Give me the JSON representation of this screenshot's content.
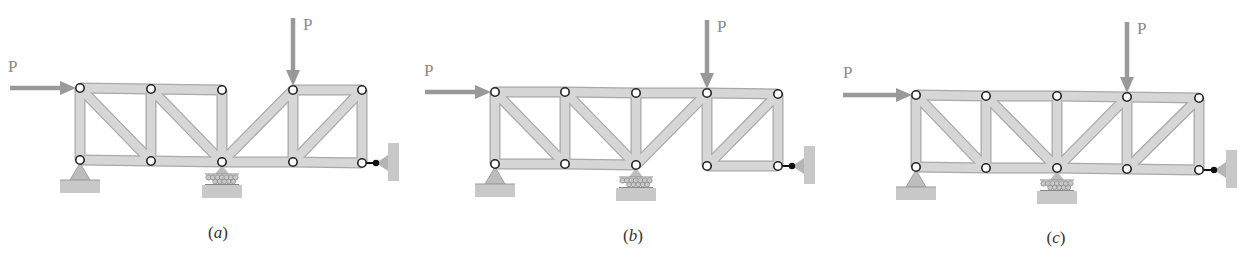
{
  "figure": {
    "panels": [
      {
        "id": "a",
        "caption": "(a)",
        "caption_letter": "a",
        "caption_pos": [
          218,
          237
        ],
        "load_label": "P",
        "joints": {
          "top": [
            [
              80,
              88
            ],
            [
              151,
              89
            ],
            [
              222,
              90
            ],
            [
              293,
              90
            ],
            [
              362,
              90
            ]
          ],
          "bottom": [
            [
              80,
              160
            ],
            [
              151,
              161
            ],
            [
              222,
              162
            ],
            [
              293,
              162
            ],
            [
              362,
              163
            ]
          ]
        },
        "members": [
          [
            "t0",
            "t1"
          ],
          [
            "t1",
            "t2"
          ],
          [
            "t3",
            "t4"
          ],
          [
            "b0",
            "b1"
          ],
          [
            "b1",
            "b2"
          ],
          [
            "b2",
            "b3"
          ],
          [
            "b3",
            "b4"
          ],
          [
            "t0",
            "b0"
          ],
          [
            "t1",
            "b1"
          ],
          [
            "t2",
            "b2"
          ],
          [
            "t3",
            "b3"
          ],
          [
            "t4",
            "b4"
          ],
          [
            "t0",
            "b1"
          ],
          [
            "t1",
            "b2"
          ],
          [
            "b2",
            "t3"
          ],
          [
            "b3",
            "t4"
          ]
        ],
        "horizontal_load": {
          "from": [
            10,
            88
          ],
          "to": [
            76,
            88
          ],
          "label_pos": [
            8,
            72
          ]
        },
        "vertical_load": {
          "from": [
            293,
            18
          ],
          "to": [
            293,
            86
          ],
          "label_pos": [
            303,
            30
          ]
        },
        "pin_support": {
          "joint": "b0"
        },
        "roller_support": {
          "joint": "b2"
        },
        "link_support": {
          "joint": "b4",
          "wall_x": 388
        }
      },
      {
        "id": "b",
        "caption": "(b)",
        "caption_letter": "b",
        "caption_pos": [
          633,
          240
        ],
        "load_label": "P",
        "joints": {
          "top": [
            [
              495,
              92
            ],
            [
              565,
              92
            ],
            [
              636,
              93
            ],
            [
              707,
              93
            ],
            [
              778,
              94
            ]
          ],
          "bottom": [
            [
              495,
              164
            ],
            [
              565,
              164
            ],
            [
              636,
              165
            ],
            [
              707,
              166
            ],
            [
              778,
              166
            ]
          ]
        },
        "members": [
          [
            "t0",
            "t1"
          ],
          [
            "t1",
            "t2"
          ],
          [
            "t2",
            "t3"
          ],
          [
            "t3",
            "t4"
          ],
          [
            "b0",
            "b1"
          ],
          [
            "b1",
            "b2"
          ],
          [
            "b3",
            "b4"
          ],
          [
            "t0",
            "b0"
          ],
          [
            "t1",
            "b1"
          ],
          [
            "t2",
            "b2"
          ],
          [
            "t3",
            "b3"
          ],
          [
            "t4",
            "b4"
          ],
          [
            "t0",
            "b1"
          ],
          [
            "t1",
            "b2"
          ],
          [
            "b2",
            "t3"
          ],
          [
            "b3",
            "t4"
          ]
        ],
        "horizontal_load": {
          "from": [
            425,
            92
          ],
          "to": [
            491,
            92
          ],
          "label_pos": [
            424,
            76
          ]
        },
        "vertical_load": {
          "from": [
            707,
            20
          ],
          "to": [
            707,
            89
          ],
          "label_pos": [
            717,
            32
          ]
        },
        "pin_support": {
          "joint": "b0"
        },
        "roller_support": {
          "joint": "b2"
        },
        "link_support": {
          "joint": "b4",
          "wall_x": 804
        }
      },
      {
        "id": "c",
        "caption": "(c)",
        "caption_letter": "c",
        "caption_pos": [
          1056,
          242
        ],
        "load_label": "P",
        "joints": {
          "top": [
            [
              916,
              95
            ],
            [
              986,
              96
            ],
            [
              1057,
              96
            ],
            [
              1127,
              97
            ],
            [
              1199,
              98
            ]
          ],
          "bottom": [
            [
              916,
              167
            ],
            [
              986,
              168
            ],
            [
              1057,
              168
            ],
            [
              1127,
              169
            ],
            [
              1199,
              170
            ]
          ]
        },
        "members": [
          [
            "t0",
            "t1"
          ],
          [
            "t1",
            "t2"
          ],
          [
            "t2",
            "t3"
          ],
          [
            "t3",
            "t4"
          ],
          [
            "b0",
            "b1"
          ],
          [
            "b1",
            "b2"
          ],
          [
            "b2",
            "b3"
          ],
          [
            "b3",
            "b4"
          ],
          [
            "t0",
            "b0"
          ],
          [
            "t1",
            "b1"
          ],
          [
            "t2",
            "b2"
          ],
          [
            "t3",
            "b3"
          ],
          [
            "t4",
            "b4"
          ],
          [
            "t0",
            "b1"
          ],
          [
            "t1",
            "b2"
          ],
          [
            "b2",
            "t3"
          ],
          [
            "b3",
            "t4"
          ]
        ],
        "horizontal_load": {
          "from": [
            843,
            95
          ],
          "to": [
            912,
            95
          ],
          "label_pos": [
            843,
            78
          ]
        },
        "vertical_load": {
          "from": [
            1127,
            22
          ],
          "to": [
            1127,
            93
          ],
          "label_pos": [
            1137,
            34
          ]
        },
        "pin_support": {
          "joint": "b0"
        },
        "roller_support": {
          "joint": "b2"
        },
        "link_support": {
          "joint": "b4",
          "wall_x": 1226
        }
      }
    ],
    "colors": {
      "member_fill": "#d6d6d6",
      "member_edge": "#a8a8a8",
      "load_arrow": "#999999",
      "ground": "#c8c8c8",
      "joint_fill": "#ffffff",
      "joint_edge": "#222222",
      "link": "#111111"
    }
  }
}
